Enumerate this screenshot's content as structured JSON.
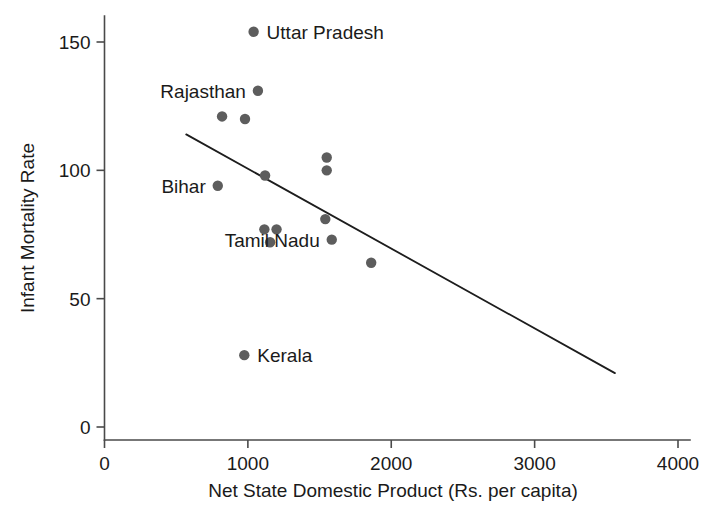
{
  "chart_data": {
    "type": "scatter",
    "title": "",
    "xlabel": "Net State Domestic Product (Rs. per capita)",
    "ylabel": "Infant Mortality Rate",
    "xlim": [
      0,
      4000
    ],
    "ylim": [
      0,
      160
    ],
    "grid": false,
    "legend": "none",
    "xticks": [
      0,
      1000,
      2000,
      3000,
      4000
    ],
    "xtick_labels": [
      "0",
      "1000",
      "2000",
      "3000",
      "4000"
    ],
    "yticks": [
      0,
      50,
      100,
      150
    ],
    "ytick_labels": [
      "0",
      "50",
      "100",
      "150"
    ],
    "marker_color": "#5d5d5d",
    "line_color": "#1d1d1d",
    "axis_color": "#4a4a4a",
    "points": [
      {
        "x": 1040,
        "y": 154,
        "label": "Uttar Pradesh",
        "label_side": "right"
      },
      {
        "x": 1070,
        "y": 131,
        "label": "Rajasthan",
        "label_side": "left"
      },
      {
        "x": 820,
        "y": 121,
        "label": "",
        "label_side": ""
      },
      {
        "x": 980,
        "y": 120,
        "label": "",
        "label_side": ""
      },
      {
        "x": 1550,
        "y": 105,
        "label": "",
        "label_side": ""
      },
      {
        "x": 1550,
        "y": 100,
        "label": "",
        "label_side": ""
      },
      {
        "x": 1120,
        "y": 98,
        "label": "",
        "label_side": ""
      },
      {
        "x": 790,
        "y": 94,
        "label": "Bihar",
        "label_side": "left"
      },
      {
        "x": 1540,
        "y": 81,
        "label": "",
        "label_side": ""
      },
      {
        "x": 1115,
        "y": 77,
        "label": "",
        "label_side": ""
      },
      {
        "x": 1200,
        "y": 77,
        "label": "",
        "label_side": ""
      },
      {
        "x": 1585,
        "y": 73,
        "label": "Tamil Nadu",
        "label_side": "left"
      },
      {
        "x": 1155,
        "y": 72,
        "label": "",
        "label_side": ""
      },
      {
        "x": 1860,
        "y": 64,
        "label": "",
        "label_side": ""
      },
      {
        "x": 975,
        "y": 28,
        "label": "Kerala",
        "label_side": "right"
      }
    ],
    "trend_line": {
      "x_start": 570,
      "y_start": 114,
      "x_end": 3560,
      "y_end": 21
    }
  }
}
